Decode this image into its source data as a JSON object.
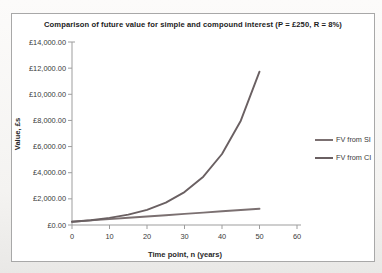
{
  "colors": {
    "si_line": "#7b7071",
    "ci_line": "#6a6062",
    "axis": "#9d9d9d",
    "frame_border": "#a8a8a8",
    "tick_text": "#3a3a3a",
    "title_text": "#1c1c1c",
    "chart_background": "#ffffff"
  },
  "chart_data": {
    "type": "line",
    "title": "Comparison of future value for simple and compound interest (P = £250, R = 8%)",
    "xlabel": "Time point, n (years)",
    "ylabel": "Value, £s",
    "xlim": [
      0,
      60
    ],
    "ylim": [
      0,
      14000
    ],
    "x_ticks": [
      0,
      10,
      20,
      30,
      40,
      50,
      60
    ],
    "y_ticks": [
      0,
      2000,
      4000,
      6000,
      8000,
      10000,
      12000,
      14000
    ],
    "y_tick_labels": [
      "£0.00",
      "£2,000.00",
      "£4,000.00",
      "£6,000.00",
      "£8,000.00",
      "£10,000.00",
      "£12,000.00",
      "£14,000.00"
    ],
    "grid": false,
    "legend_position": "right",
    "x": [
      0,
      5,
      10,
      15,
      20,
      25,
      30,
      35,
      40,
      45,
      50
    ],
    "series": [
      {
        "name": "FV from SI",
        "color": "#7b7071",
        "values": [
          250,
          350,
          450,
          550,
          650,
          750,
          850,
          950,
          1050,
          1150,
          1250
        ]
      },
      {
        "name": "FV from CI",
        "color": "#6a6062",
        "values": [
          250,
          367.33,
          539.73,
          793.04,
          1165.24,
          1712.12,
          2515.66,
          3696.3,
          5431.16,
          7980.16,
          11725.3
        ]
      }
    ]
  }
}
